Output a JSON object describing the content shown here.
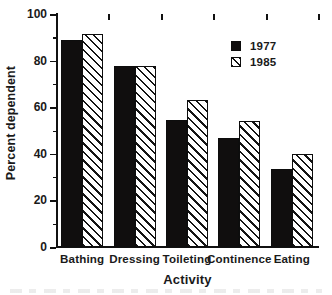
{
  "chart_data": {
    "type": "bar",
    "title": "",
    "xlabel": "Activity",
    "ylabel": "Percent dependent",
    "categories": [
      "Bathing",
      "Dressing",
      "Toileting",
      "Continence",
      "Eating"
    ],
    "series": [
      {
        "name": "1977",
        "values": [
          89,
          77.5,
          54.5,
          47,
          33.5
        ],
        "color": "#100e0e",
        "fill": "solid"
      },
      {
        "name": "1985",
        "values": [
          91.5,
          77.5,
          63,
          54,
          40
        ],
        "color": "#ffffff",
        "fill": "diagonal-hatch"
      }
    ],
    "ylim": [
      0,
      100
    ],
    "y_major_ticks": [
      0,
      20,
      40,
      60,
      80,
      100
    ],
    "y_minor_ticks": [
      10,
      30,
      50,
      70,
      90
    ],
    "y_tick_labels": [
      "0",
      "20",
      "40",
      "60",
      "80",
      "100"
    ],
    "grid": false,
    "legend_position": "top-right",
    "legend_entries": [
      "1977",
      "1985"
    ],
    "axis_color": "#111111",
    "background": "#ffffff"
  },
  "axes": {
    "y_title": "Percent dependent",
    "x_title": "Activity"
  },
  "legend": {
    "items": [
      {
        "label": "1977"
      },
      {
        "label": "1985"
      }
    ]
  }
}
